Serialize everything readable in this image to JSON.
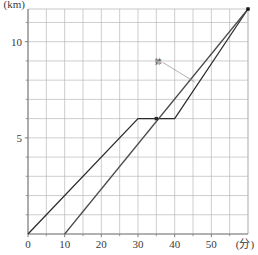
{
  "chart_data": {
    "type": "line",
    "title": "",
    "xlabel": "(分)",
    "ylabel": "(km)",
    "xlim": [
      0,
      60
    ],
    "ylim": [
      0,
      11.7
    ],
    "grid": true,
    "grid_x_step": 5,
    "grid_y_step": 1,
    "xticks": [
      0,
      10,
      20,
      30,
      40,
      50
    ],
    "xticklabels": [
      "0",
      "10",
      "20",
      "30",
      "40",
      "50"
    ],
    "yticks": [
      5,
      10
    ],
    "yticklabels": [
      "5",
      "10"
    ],
    "x_minor_ticks": [
      5,
      15,
      25,
      35,
      45,
      55
    ],
    "y_minor_ticks": [
      1,
      2,
      3,
      4,
      6,
      7,
      8,
      9,
      11
    ],
    "legend_position": "inline-annotation",
    "series": [
      {
        "name": "younger",
        "label": "",
        "color": "#2b2b2b",
        "points": [
          [
            0,
            0
          ],
          [
            30,
            6
          ],
          [
            40,
            6
          ],
          [
            60,
            11.7
          ]
        ]
      },
      {
        "name": "older-sister",
        "label": "姉",
        "color": "#4a4a4a",
        "points": [
          [
            10,
            0
          ],
          [
            60,
            11.7
          ]
        ]
      }
    ],
    "markers": [
      {
        "name": "crossing-point",
        "x": 35,
        "y": 6,
        "shape": "square",
        "color": "#2b2b2b"
      },
      {
        "name": "endpoint",
        "x": 60,
        "y": 11.7,
        "shape": "square",
        "color": "#111111"
      }
    ],
    "annotations": [
      {
        "name": "older-sister-label",
        "text": "姉",
        "x": 35.5,
        "y": 8.85,
        "leader_to_x": 45.5,
        "leader_to_y": 7.9
      }
    ],
    "colors": {
      "grid": "#b9b9b9",
      "axis": "#7d7d7d",
      "text": "#3a3a3a",
      "series_primary": "#2b2b2b",
      "series_secondary": "#4a4a4a",
      "background": "#ffffff"
    }
  }
}
